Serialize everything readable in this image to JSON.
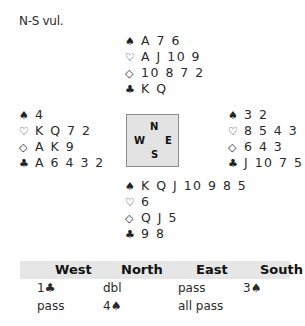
{
  "vulnerability": "N-S vul.",
  "suits": {
    "spades": "♠",
    "hearts": "♡",
    "diamonds": "◇",
    "clubs": "♣"
  },
  "hands": {
    "north": {
      "spades": "A 7 6",
      "hearts": "A J 10 9",
      "diamonds": "10 8 7 2",
      "clubs": "K Q"
    },
    "west": {
      "spades": "4",
      "hearts": "K Q 7 2",
      "diamonds": "A K 9",
      "clubs": "A 6 4 3 2"
    },
    "east": {
      "spades": "3 2",
      "hearts": "8 5 4 3",
      "diamonds": "6 4 3",
      "clubs": "J 10 7 5"
    },
    "south": {
      "spades": "K Q J 10 9 8 5",
      "hearts": "6",
      "diamonds": "Q J 5",
      "clubs": "9 8"
    }
  },
  "compass": {
    "n": "N",
    "w": "W",
    "e": "E",
    "s": "S"
  },
  "bidding": {
    "headers": [
      "West",
      "North",
      "East",
      "South"
    ],
    "rows": [
      [
        "1♣",
        "dbl",
        "pass",
        "3♠"
      ],
      [
        "pass",
        "4♠",
        "all pass",
        ""
      ]
    ]
  }
}
